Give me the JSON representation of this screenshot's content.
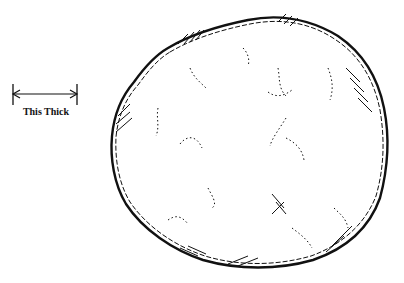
{
  "illustration": {
    "subject": "rough round patty outline sketch",
    "dimension_label": "This Thick",
    "ink_color": "#111111",
    "background": "#ffffff"
  }
}
